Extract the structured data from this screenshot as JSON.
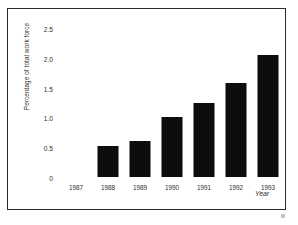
{
  "chart_data": {
    "type": "bar",
    "title": "",
    "xlabel": "Year",
    "ylabel": "Percentage of total work force",
    "categories": [
      "1987",
      "1988",
      "1989",
      "1990",
      "1991",
      "1992",
      "1993"
    ],
    "values": [
      0,
      0.52,
      0.61,
      1.01,
      1.25,
      1.57,
      2.05
    ],
    "series": [
      {
        "name": "Percentage of total work force",
        "values": [
          0,
          0.52,
          0.61,
          1.01,
          1.25,
          1.57,
          2.05
        ]
      }
    ],
    "ylim": [
      0,
      2.5
    ],
    "ytick_labels": [
      "0",
      "0.5",
      "1.0",
      "1.5",
      "2.0",
      "2.5"
    ],
    "ytick_values": [
      0,
      0.5,
      1.0,
      1.5,
      2.0,
      2.5
    ],
    "grid": false,
    "legend": "none",
    "bar_color": "#0d0d0d",
    "background_color": "#ffffff",
    "frame_color": "#2b2b2b"
  }
}
